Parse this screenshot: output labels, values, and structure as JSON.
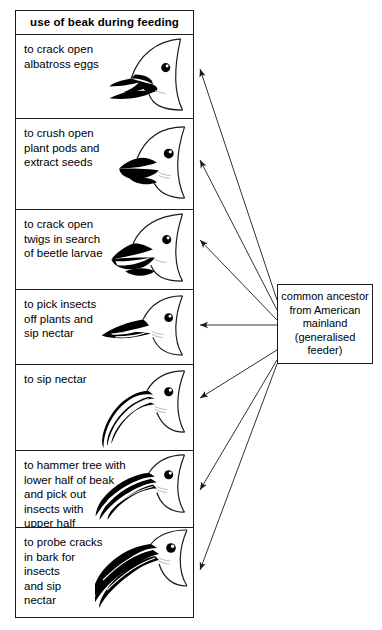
{
  "diagram": {
    "title_cell": "use of beak during feeding",
    "ancestor": {
      "text": "common ancestor\nfrom American\nmainland\n(generalised\nfeeder)"
    },
    "panels": [
      {
        "id": "panel-albatross-eggs",
        "label": "to crack open\nalbatross eggs",
        "beak_icon": "thick-conical-beak-icon"
      },
      {
        "id": "panel-plant-pods",
        "label": "to crush open\nplant pods and\nextract seeds",
        "beak_icon": "heavy-crushing-beak-icon"
      },
      {
        "id": "panel-beetle-larvae",
        "label": "to crack open\ntwigs in search\nof beetle larvae",
        "beak_icon": "stout-wedge-beak-icon"
      },
      {
        "id": "panel-pick-insects",
        "label": "to pick insects\noff plants and\nsip nectar",
        "beak_icon": "slender-pointed-beak-icon"
      },
      {
        "id": "panel-sip-nectar",
        "label": "to sip nectar",
        "beak_icon": "long-curved-beak-icon"
      },
      {
        "id": "panel-hammer-tree",
        "label": "to hammer tree with\nlower half of beak\nand pick out\ninsects with\nupper half",
        "beak_icon": "long-straight-probing-beak-icon"
      },
      {
        "id": "panel-probe-bark",
        "label": "to probe cracks\nin bark for\ninsects\nand sip\nnectar",
        "beak_icon": "very-long-decurved-beak-icon"
      }
    ],
    "arrows": [
      {
        "name": "arrow-to-albatross-eggs",
        "from": [
          277,
          300
        ],
        "to": [
          199,
          69
        ]
      },
      {
        "name": "arrow-to-plant-pods",
        "from": [
          277,
          310
        ],
        "to": [
          199,
          160
        ]
      },
      {
        "name": "arrow-to-beetle-larvae",
        "from": [
          277,
          320
        ],
        "to": [
          199,
          240
        ]
      },
      {
        "name": "arrow-to-pick-insects",
        "from": [
          277,
          325
        ],
        "to": [
          199,
          325
        ]
      },
      {
        "name": "arrow-to-sip-nectar",
        "from": [
          277,
          350
        ],
        "to": [
          199,
          398
        ]
      },
      {
        "name": "arrow-to-hammer-tree",
        "from": [
          277,
          360
        ],
        "to": [
          199,
          490
        ]
      },
      {
        "name": "arrow-to-probe-bark",
        "from": [
          277,
          364
        ],
        "to": [
          199,
          570
        ]
      }
    ],
    "colors": {
      "line": "#1a1a1a",
      "fill": "#000000",
      "background": "#ffffff"
    }
  }
}
